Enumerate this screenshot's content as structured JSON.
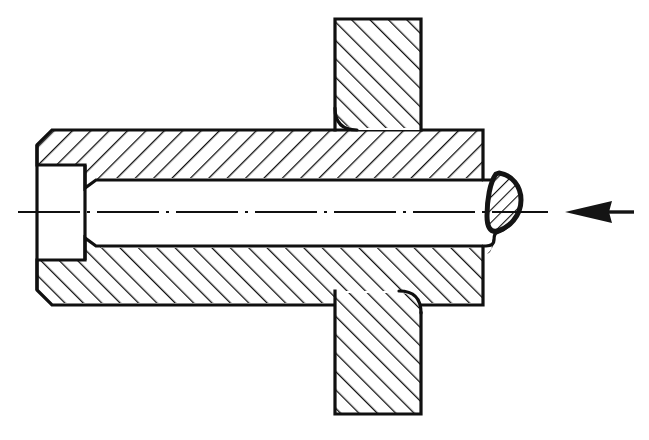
{
  "figure": {
    "title": "Cross-section assembly drawing",
    "canvas": {
      "width": 649,
      "height": 440,
      "background": "#ffffff"
    },
    "style": {
      "line_color": "#101010",
      "fill_color": "#ffffff",
      "outline_width_px": 3.2,
      "hatch_line_width_px": 2.4,
      "hatch_spacing_px": 13,
      "centerline_width_px": 2.0
    },
    "parts": [
      {
        "id": "upper-plate",
        "name": "upper-plate-section",
        "label": "Upper plate section",
        "hatch_direction": "forward-slash",
        "bounds": {
          "x": 334,
          "y": 18,
          "width": 88,
          "height": 112
        }
      },
      {
        "id": "lower-plate",
        "name": "lower-plate-section",
        "label": "Lower plate section",
        "hatch_direction": "forward-slash",
        "bounds": {
          "x": 334,
          "y": 291,
          "width": 88,
          "height": 124
        }
      },
      {
        "id": "sleeve-upper-wall",
        "name": "sleeve-upper-wall-section",
        "label": "Sleeve upper wall",
        "hatch_direction": "back-slash",
        "bounds": {
          "x": 37,
          "y": 130,
          "width": 448,
          "height": 50
        }
      },
      {
        "id": "sleeve-lower-wall",
        "name": "sleeve-lower-wall-section",
        "label": "Sleeve lower wall",
        "hatch_direction": "back-slash",
        "bounds": {
          "x": 37,
          "y": 246,
          "width": 448,
          "height": 59
        }
      },
      {
        "id": "shaft-bore",
        "name": "shaft-bore-cavity",
        "label": "Shaft / bore (unsectioned)",
        "hatch_direction": "none",
        "bounds": {
          "x": 85,
          "y": 180,
          "width": 423,
          "height": 66
        }
      },
      {
        "id": "weld-bead",
        "name": "weld-bead-teardrop",
        "label": "Weld bead / burr (teardrop)",
        "hatch_direction": "back-slash",
        "bounds": {
          "x": 486,
          "y": 172,
          "width": 38,
          "height": 82
        }
      }
    ],
    "centerline": {
      "name": "axis-centerline",
      "label": "Axis of rotation centre line",
      "style": "dash-dot",
      "y": 212,
      "x_start": 18,
      "x_end": 548
    },
    "leader_arrow": {
      "name": "leader-arrow",
      "label": "Pointer arrow to weld bead",
      "direction": "left",
      "tip_x": 565,
      "tail_x": 634,
      "y": 212
    }
  }
}
